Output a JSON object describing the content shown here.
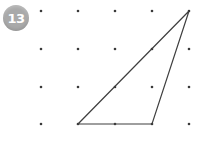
{
  "problem": {
    "number": "13",
    "badge_color": "#a9a9a9",
    "badge_text_color": "#ffffff"
  },
  "canvas": {
    "width": 199,
    "height": 161,
    "background": "#ffffff"
  },
  "chart_data": {
    "type": "scatter",
    "title": "",
    "xlabel": "",
    "ylabel": "",
    "grid": false,
    "legend_position": "none",
    "xlim": [
      0,
      199
    ],
    "ylim": [
      0,
      161
    ],
    "dot_grid": {
      "rows": 4,
      "columns": 5,
      "x_spacing": 37,
      "y_spacing": 38,
      "origin_x": 41,
      "origin_y": 11,
      "dot_radius": 1.3,
      "dot_color": "#3a3a3a",
      "points": [
        {
          "col": 1,
          "row": 1,
          "x": 41,
          "y": 11
        },
        {
          "col": 2,
          "row": 1,
          "x": 78,
          "y": 11
        },
        {
          "col": 3,
          "row": 1,
          "x": 115,
          "y": 11
        },
        {
          "col": 4,
          "row": 1,
          "x": 152,
          "y": 11
        },
        {
          "col": 5,
          "row": 1,
          "x": 189,
          "y": 11
        },
        {
          "col": 1,
          "row": 2,
          "x": 41,
          "y": 49
        },
        {
          "col": 2,
          "row": 2,
          "x": 78,
          "y": 49
        },
        {
          "col": 3,
          "row": 2,
          "x": 115,
          "y": 49
        },
        {
          "col": 4,
          "row": 2,
          "x": 152,
          "y": 49
        },
        {
          "col": 5,
          "row": 2,
          "x": 189,
          "y": 49
        },
        {
          "col": 1,
          "row": 3,
          "x": 41,
          "y": 87
        },
        {
          "col": 2,
          "row": 3,
          "x": 78,
          "y": 87
        },
        {
          "col": 3,
          "row": 3,
          "x": 115,
          "y": 87
        },
        {
          "col": 4,
          "row": 3,
          "x": 152,
          "y": 87
        },
        {
          "col": 5,
          "row": 3,
          "x": 189,
          "y": 87
        },
        {
          "col": 1,
          "row": 4,
          "x": 41,
          "y": 124
        },
        {
          "col": 2,
          "row": 4,
          "x": 78,
          "y": 124
        },
        {
          "col": 3,
          "row": 4,
          "x": 115,
          "y": 124
        },
        {
          "col": 4,
          "row": 4,
          "x": 152,
          "y": 124
        },
        {
          "col": 5,
          "row": 4,
          "x": 189,
          "y": 124
        }
      ]
    },
    "shapes": [
      {
        "name": "triangle",
        "closed": true,
        "fill": "none",
        "stroke": "#3f3f3f",
        "stroke_width": 1.2,
        "vertices": [
          {
            "label": "apex",
            "col": 5,
            "row": 1,
            "x": 189,
            "y": 11
          },
          {
            "label": "bottom-left",
            "col": 2,
            "row": 4,
            "x": 78,
            "y": 124
          },
          {
            "label": "bottom-right",
            "col": 4,
            "row": 4,
            "x": 152,
            "y": 124
          }
        ],
        "points_string": "189,11 78,124 152,124"
      }
    ]
  }
}
